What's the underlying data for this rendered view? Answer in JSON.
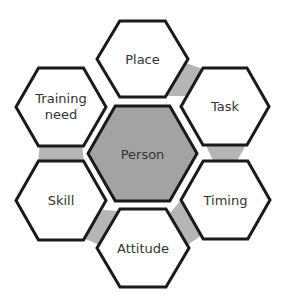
{
  "diagram": {
    "type": "hexagon-cluster",
    "center": {
      "label": "Person",
      "fill": "#a3a3a3"
    },
    "nodes": [
      {
        "id": "place",
        "label": "Place"
      },
      {
        "id": "task",
        "label": "Task"
      },
      {
        "id": "timing",
        "label": "Timing"
      },
      {
        "id": "attitude",
        "label": "Attitude"
      },
      {
        "id": "skill",
        "label": "Skill"
      },
      {
        "id": "training-need",
        "label_line1": "Training",
        "label_line2": "need"
      }
    ],
    "connectors": [
      {
        "from": "place",
        "to": "task"
      },
      {
        "from": "task",
        "to": "timing"
      },
      {
        "from": "timing",
        "to": "attitude"
      },
      {
        "from": "attitude",
        "to": "skill"
      },
      {
        "from": "skill",
        "to": "training-need"
      }
    ],
    "colors": {
      "outline": "#1a1a1a",
      "outer_fill": "#ffffff",
      "center_fill": "#a3a3a3",
      "connector_fill": "#b5b5b5",
      "text": "#333333"
    }
  }
}
